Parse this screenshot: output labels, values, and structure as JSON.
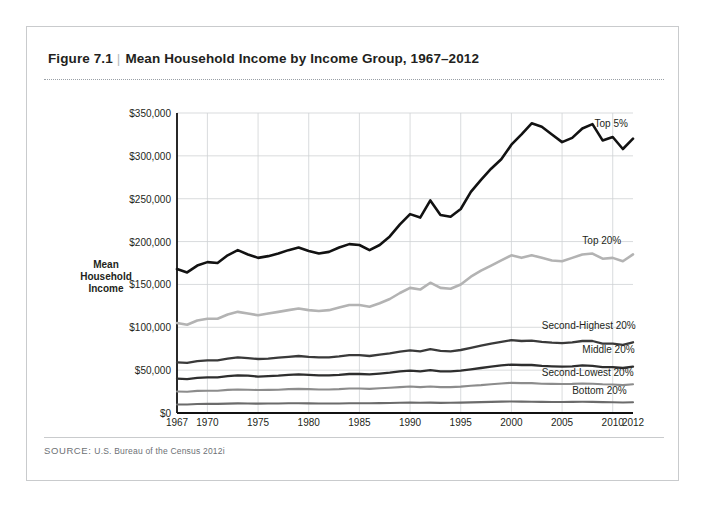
{
  "figure": {
    "number": "Figure 7.1",
    "separator": "|",
    "title": "Mean Household Income by Income Group, 1967–2012",
    "source_label": "SOURCE:",
    "source_text": "U.S. Bureau of the Census 2012i"
  },
  "axis": {
    "y_title_line1": "Mean",
    "y_title_line2": "Household",
    "y_title_line3": "Income"
  },
  "chart_data": {
    "type": "line",
    "title": "Mean Household Income by Income Group, 1967–2012",
    "xlabel": "",
    "ylabel": "Mean Household Income",
    "xlim": [
      1967,
      2012
    ],
    "ylim": [
      0,
      350000
    ],
    "grid": true,
    "legend_position": "inline-right",
    "y_ticks": [
      0,
      50000,
      100000,
      150000,
      200000,
      250000,
      300000,
      350000
    ],
    "y_tick_labels": [
      "$0",
      "$50,000",
      "$100,000",
      "$150,000",
      "$200,000",
      "$250,000",
      "$300,000",
      "$350,000"
    ],
    "x_ticks": [
      1967,
      1970,
      1975,
      1980,
      1985,
      1990,
      1995,
      2000,
      2005,
      2010,
      2012
    ],
    "x_tick_labels": [
      "1967",
      "1970",
      "1975",
      "1980",
      "1985",
      "1990",
      "1995",
      "2000",
      "2005",
      "2010",
      "2012"
    ],
    "x": [
      1967,
      1968,
      1969,
      1970,
      1971,
      1972,
      1973,
      1974,
      1975,
      1976,
      1977,
      1978,
      1979,
      1980,
      1981,
      1982,
      1983,
      1984,
      1985,
      1986,
      1987,
      1988,
      1989,
      1990,
      1991,
      1992,
      1993,
      1994,
      1995,
      1996,
      1997,
      1998,
      1999,
      2000,
      2001,
      2002,
      2003,
      2004,
      2005,
      2006,
      2007,
      2008,
      2009,
      2010,
      2011,
      2012
    ],
    "series": [
      {
        "name": "Top 5%",
        "color": "#121212",
        "width": 2.6,
        "label": "Top 5%",
        "values": [
          168000,
          164000,
          172000,
          176000,
          175000,
          184000,
          190000,
          185000,
          181000,
          183000,
          186000,
          190000,
          193000,
          189000,
          186000,
          188000,
          193000,
          197000,
          196000,
          190000,
          196000,
          206000,
          220000,
          232000,
          228000,
          248000,
          231000,
          229000,
          238000,
          258000,
          272000,
          285000,
          296000,
          313000,
          325000,
          338000,
          334000,
          325000,
          316000,
          321000,
          332000,
          337000,
          318000,
          322000,
          308000,
          320000
        ]
      },
      {
        "name": "Top 20%",
        "color": "#b3b3b3",
        "width": 2.6,
        "label": "Top 20%",
        "values": [
          105000,
          103000,
          108000,
          110000,
          110000,
          115000,
          118000,
          116000,
          114000,
          116000,
          118000,
          120000,
          122000,
          120000,
          119000,
          120000,
          123000,
          126000,
          126000,
          124000,
          128000,
          133000,
          140000,
          146000,
          144000,
          152000,
          146000,
          145000,
          150000,
          159000,
          166000,
          172000,
          178000,
          184000,
          181000,
          184000,
          181000,
          178000,
          177000,
          181000,
          185000,
          186000,
          180000,
          181000,
          177000,
          185000
        ]
      },
      {
        "name": "Second-Highest 20%",
        "color": "#3a3a3a",
        "width": 2.3,
        "label": "Second-Highest 20%",
        "values": [
          59000,
          58500,
          60500,
          61500,
          61500,
          63500,
          65000,
          64000,
          63000,
          63500,
          64500,
          65500,
          66500,
          65500,
          65000,
          65000,
          66000,
          67500,
          67500,
          66500,
          68000,
          69500,
          71500,
          73000,
          72000,
          74500,
          72500,
          72000,
          73500,
          76000,
          78500,
          81000,
          83000,
          85000,
          84000,
          84500,
          83000,
          82000,
          81500,
          82500,
          84000,
          84000,
          81000,
          81000,
          79500,
          82500
        ]
      },
      {
        "name": "Middle 20%",
        "color": "#2e2e2e",
        "width": 2.3,
        "label": "Middle 20%",
        "values": [
          40000,
          39500,
          41000,
          41500,
          41500,
          43000,
          44000,
          43500,
          42500,
          43000,
          43500,
          44500,
          45000,
          44500,
          44000,
          44000,
          44500,
          45500,
          45500,
          45000,
          46000,
          47000,
          48500,
          49500,
          48500,
          50000,
          48500,
          48500,
          49500,
          51000,
          52500,
          54000,
          55500,
          56500,
          56000,
          56000,
          55000,
          54500,
          54000,
          54500,
          55500,
          55000,
          53500,
          53500,
          52500,
          54000
        ]
      },
      {
        "name": "Second-Lowest 20%",
        "color": "#8c8c8c",
        "width": 2.1,
        "label": "Second-Lowest 20%",
        "values": [
          25000,
          24800,
          25800,
          26000,
          26000,
          27000,
          27500,
          27200,
          26800,
          27000,
          27200,
          27800,
          28200,
          27800,
          27500,
          27500,
          27800,
          28500,
          28500,
          28200,
          28800,
          29500,
          30200,
          31000,
          30200,
          31000,
          30200,
          30200,
          30800,
          31800,
          32500,
          33500,
          34500,
          35200,
          34800,
          34800,
          34200,
          34000,
          33800,
          34000,
          34500,
          34200,
          33500,
          33200,
          32500,
          33500
        ]
      },
      {
        "name": "Bottom 20%",
        "color": "#6b6b6b",
        "width": 2.1,
        "label": "Bottom 20%",
        "values": [
          10000,
          10000,
          10500,
          10600,
          10600,
          10900,
          11200,
          11100,
          10900,
          11000,
          11100,
          11300,
          11400,
          11200,
          11000,
          11000,
          11100,
          11300,
          11400,
          11300,
          11500,
          11700,
          12000,
          12200,
          11900,
          12100,
          11800,
          11900,
          12100,
          12400,
          12700,
          13000,
          13300,
          13500,
          13300,
          13200,
          13000,
          12900,
          12900,
          13000,
          13100,
          13000,
          12700,
          12600,
          12300,
          12600
        ]
      }
    ],
    "annotations": [
      {
        "text": "Top 5%",
        "x": 2008.2,
        "y": 336000
      },
      {
        "text": "Top 20%",
        "x": 2007.0,
        "y": 200000
      },
      {
        "text": "Second-Highest 20%",
        "x": 2003.0,
        "y": 100000
      },
      {
        "text": "Middle 20%",
        "x": 2007.0,
        "y": 72000
      },
      {
        "text": "Second-Lowest 20%",
        "x": 2003.0,
        "y": 46000
      },
      {
        "text": "Bottom 20%",
        "x": 2006.0,
        "y": 25000
      }
    ]
  }
}
